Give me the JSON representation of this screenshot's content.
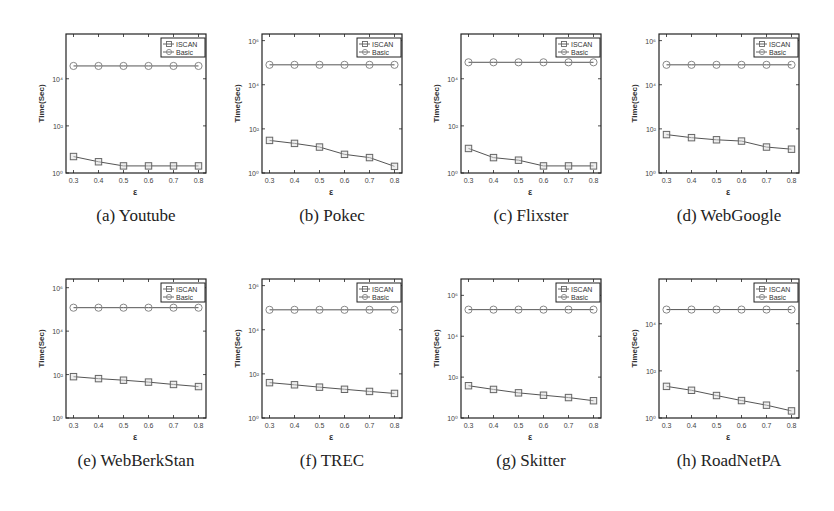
{
  "chart_data": [
    {
      "type": "line",
      "id": "a",
      "caption": "(a) Youtube",
      "title": "Youtube",
      "xlabel": "ε",
      "ylabel": "Time(Sec)",
      "yscale": "log",
      "x": [
        0.3,
        0.4,
        0.5,
        0.6,
        0.7,
        0.8
      ],
      "xlim": [
        0.27,
        0.83
      ],
      "ylim_log10": [
        0,
        5.9
      ],
      "ytick_labels": [
        "10^0",
        "10^2",
        "10^4"
      ],
      "ytick_exps": [
        0,
        2,
        4
      ],
      "legend": [
        "ISCAN",
        "Basic"
      ],
      "legend_position": "upper right",
      "grid": false,
      "series": [
        {
          "name": "ISCAN",
          "marker": "square",
          "values": [
            5,
            3,
            2,
            2,
            2,
            2
          ]
        },
        {
          "name": "Basic",
          "marker": "circle",
          "values": [
            35000,
            35000,
            35000,
            35000,
            35000,
            35000
          ]
        }
      ]
    },
    {
      "type": "line",
      "id": "b",
      "caption": "(b) Pokec",
      "title": "Pokec",
      "xlabel": "ε",
      "ylabel": "Time(Sec)",
      "yscale": "log",
      "x": [
        0.3,
        0.4,
        0.5,
        0.6,
        0.7,
        0.8
      ],
      "xlim": [
        0.27,
        0.83
      ],
      "ylim_log10": [
        0,
        6.3
      ],
      "ytick_labels": [
        "10^0",
        "10^2",
        "10^4",
        "10^6"
      ],
      "ytick_exps": [
        0,
        2,
        4,
        6
      ],
      "legend": [
        "ISCAN",
        "Basic"
      ],
      "legend_position": "upper right",
      "grid": false,
      "series": [
        {
          "name": "ISCAN",
          "marker": "square",
          "values": [
            30,
            22,
            15,
            7,
            5,
            2
          ]
        },
        {
          "name": "Basic",
          "marker": "circle",
          "values": [
            80000,
            80000,
            80000,
            80000,
            80000,
            80000
          ]
        }
      ]
    },
    {
      "type": "line",
      "id": "c",
      "caption": "(c) Flixster",
      "title": "Flixster",
      "xlabel": "ε",
      "ylabel": "Time(Sec)",
      "yscale": "log",
      "x": [
        0.3,
        0.4,
        0.5,
        0.6,
        0.7,
        0.8
      ],
      "xlim": [
        0.27,
        0.83
      ],
      "ylim_log10": [
        0,
        5.9
      ],
      "ytick_labels": [
        "10^0",
        "10^2",
        "10^4"
      ],
      "ytick_exps": [
        0,
        2,
        4
      ],
      "legend": [
        "ISCAN",
        "Basic"
      ],
      "legend_position": "upper right",
      "grid": false,
      "series": [
        {
          "name": "ISCAN",
          "marker": "square",
          "values": [
            11,
            4.5,
            3.5,
            2,
            2,
            2
          ]
        },
        {
          "name": "Basic",
          "marker": "circle",
          "values": [
            50000,
            50000,
            50000,
            50000,
            50000,
            50000
          ]
        }
      ]
    },
    {
      "type": "line",
      "id": "d",
      "caption": "(d) WebGoogle",
      "title": "WebGoogle",
      "xlabel": "ε",
      "ylabel": "Time(Sec)",
      "yscale": "log",
      "x": [
        0.3,
        0.4,
        0.5,
        0.6,
        0.7,
        0.8
      ],
      "xlim": [
        0.27,
        0.83
      ],
      "ylim_log10": [
        0,
        6.3
      ],
      "ytick_labels": [
        "10^0",
        "10^2",
        "10^4",
        "10^6"
      ],
      "ytick_exps": [
        0,
        2,
        4,
        6
      ],
      "legend": [
        "ISCAN",
        "Basic"
      ],
      "legend_position": "upper right",
      "grid": false,
      "series": [
        {
          "name": "ISCAN",
          "marker": "square",
          "values": [
            55,
            40,
            32,
            28,
            15,
            12
          ]
        },
        {
          "name": "Basic",
          "marker": "circle",
          "values": [
            80000,
            80000,
            80000,
            80000,
            80000,
            80000
          ]
        }
      ]
    },
    {
      "type": "line",
      "id": "e",
      "caption": "(e) WebBerkStan",
      "title": "WebBerkStan",
      "xlabel": "ε",
      "ylabel": "Time(Sec)",
      "yscale": "log",
      "x": [
        0.3,
        0.4,
        0.5,
        0.6,
        0.7,
        0.8
      ],
      "xlim": [
        0.27,
        0.83
      ],
      "ylim_log10": [
        0,
        6.4
      ],
      "ytick_labels": [
        "10^0",
        "10^2",
        "10^4",
        "10^6"
      ],
      "ytick_exps": [
        0,
        2,
        4,
        6
      ],
      "legend": [
        "ISCAN",
        "Basic"
      ],
      "legend_position": "upper right",
      "grid": false,
      "series": [
        {
          "name": "ISCAN",
          "marker": "square",
          "values": [
            80,
            65,
            55,
            45,
            35,
            28
          ]
        },
        {
          "name": "Basic",
          "marker": "circle",
          "values": [
            120000,
            120000,
            120000,
            120000,
            120000,
            120000
          ]
        }
      ]
    },
    {
      "type": "line",
      "id": "f",
      "caption": "(f) TREC",
      "title": "TREC",
      "xlabel": "ε",
      "ylabel": "Time(Sec)",
      "yscale": "log",
      "x": [
        0.3,
        0.4,
        0.5,
        0.6,
        0.7,
        0.8
      ],
      "xlim": [
        0.27,
        0.83
      ],
      "ylim_log10": [
        0,
        6.3
      ],
      "ytick_labels": [
        "10^0",
        "10^2",
        "10^4",
        "10^6"
      ],
      "ytick_exps": [
        0,
        2,
        4,
        6
      ],
      "legend": [
        "ISCAN",
        "Basic"
      ],
      "legend_position": "upper right",
      "grid": false,
      "series": [
        {
          "name": "ISCAN",
          "marker": "square",
          "values": [
            40,
            32,
            25,
            20,
            16,
            13
          ]
        },
        {
          "name": "Basic",
          "marker": "circle",
          "values": [
            80000,
            80000,
            80000,
            80000,
            80000,
            80000
          ]
        }
      ]
    },
    {
      "type": "line",
      "id": "g",
      "caption": "(g) Skitter",
      "title": "Skitter",
      "xlabel": "ε",
      "ylabel": "Time(Sec)",
      "yscale": "log",
      "x": [
        0.3,
        0.4,
        0.5,
        0.6,
        0.7,
        0.8
      ],
      "xlim": [
        0.27,
        0.83
      ],
      "ylim_log10": [
        0,
        6.8
      ],
      "ytick_labels": [
        "10^0",
        "10^2",
        "10^4",
        "10^6"
      ],
      "ytick_exps": [
        0,
        2,
        4,
        6
      ],
      "legend": [
        "ISCAN",
        "Basic"
      ],
      "legend_position": "upper right",
      "grid": false,
      "series": [
        {
          "name": "ISCAN",
          "marker": "square",
          "values": [
            38,
            25,
            17,
            13,
            10,
            7
          ]
        },
        {
          "name": "Basic",
          "marker": "circle",
          "values": [
            200000,
            200000,
            200000,
            200000,
            200000,
            200000
          ]
        }
      ]
    },
    {
      "type": "line",
      "id": "h",
      "caption": "(h) RoadNetPA",
      "title": "RoadNetPA",
      "xlabel": "ε",
      "ylabel": "Time(Sec)",
      "yscale": "log",
      "x": [
        0.3,
        0.4,
        0.5,
        0.6,
        0.7,
        0.8
      ],
      "xlim": [
        0.27,
        0.83
      ],
      "ylim_log10": [
        0,
        5.9
      ],
      "ytick_labels": [
        "10^0",
        "10^2",
        "10^4"
      ],
      "ytick_exps": [
        0,
        2,
        4
      ],
      "legend": [
        "ISCAN",
        "Basic"
      ],
      "legend_position": "upper right",
      "grid": false,
      "series": [
        {
          "name": "ISCAN",
          "marker": "square",
          "values": [
            22,
            15,
            9,
            5.5,
            3.5,
            2
          ]
        },
        {
          "name": "Basic",
          "marker": "circle",
          "values": [
            40000,
            40000,
            40000,
            40000,
            40000,
            40000
          ]
        }
      ]
    }
  ],
  "layout": {
    "panel_positions": [
      [
        30,
        22
      ],
      [
        226,
        22
      ],
      [
        425,
        22
      ],
      [
        623,
        22
      ],
      [
        30,
        267
      ],
      [
        226,
        267
      ],
      [
        425,
        267
      ],
      [
        623,
        267
      ]
    ],
    "colors": {
      "axis": "#222222",
      "line": "#555555",
      "marker": "#666666"
    }
  }
}
